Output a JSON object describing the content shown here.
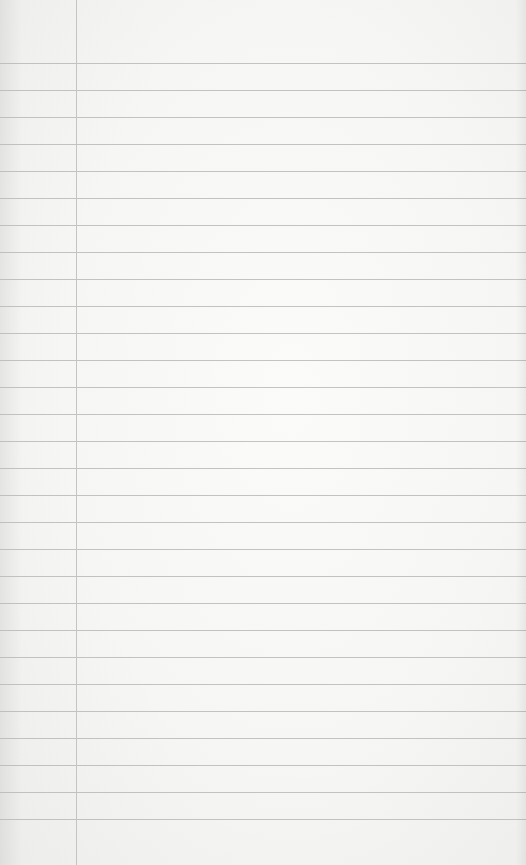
{
  "page": {
    "type": "ruled-notebook-paper",
    "content_text": "",
    "background_color": "#f6f6f5",
    "rule_color": "#b9b9b9",
    "margin_color": "#c4c4c4",
    "margin_x": 76,
    "first_rule_y": 63,
    "rule_spacing": 27,
    "rule_count": 29
  }
}
